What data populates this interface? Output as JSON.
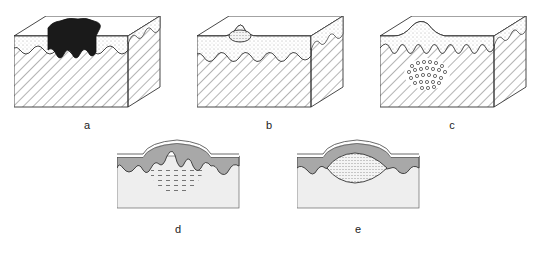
{
  "figure": {
    "panels": [
      {
        "id": "a",
        "label": "a",
        "description": "block diagram: dark lesion on skin surface penetrating epidermal ridges"
      },
      {
        "id": "b",
        "label": "b",
        "description": "block diagram: small oval lesion raised within epidermis"
      },
      {
        "id": "c",
        "label": "c",
        "description": "block diagram: cluster of round cells in dermis beneath raised surface"
      },
      {
        "id": "d",
        "label": "d",
        "description": "cross-section: dome elevation with dashed cell mass in dermis below undulating epidermis"
      },
      {
        "id": "e",
        "label": "e",
        "description": "cross-section: dome elevation with oval stippled mass replacing epidermal ridges"
      }
    ],
    "colors": {
      "line": "#333333",
      "epidermis_stipple": "#e8e8e8",
      "lesion_dark": "#1a1a1a",
      "dermis_cross": "#eeeeee",
      "epidermis_cross": "#a8a8a8"
    }
  }
}
